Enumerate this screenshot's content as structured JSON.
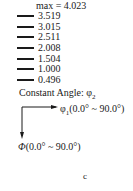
{
  "legend": {
    "max_label": "max = 4.023",
    "levels": [
      "3.519",
      "3.015",
      "2.511",
      "2.008",
      "1.504",
      "1.000",
      "0.496"
    ]
  },
  "constant_angle": {
    "label": "Constant Angle: ",
    "symbol": "φ",
    "subscript": "2"
  },
  "axes": {
    "horizontal": {
      "symbol": "φ",
      "subscript": "1",
      "range": "(0.0° ~ 90.0°)"
    },
    "vertical": {
      "symbol": "Φ",
      "range": "(0.0° ~ 90.0°)"
    }
  },
  "caption": "c"
}
